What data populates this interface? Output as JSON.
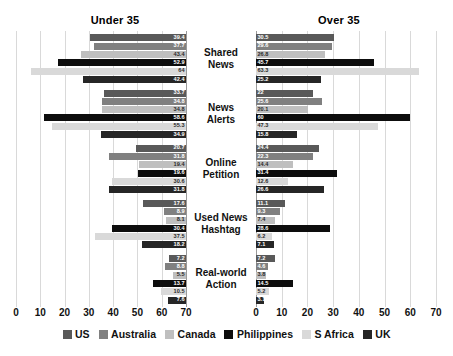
{
  "chart_data": {
    "type": "bar",
    "title": "",
    "orientation": "horizontal",
    "layout": "diverging butterfly (two mirrored panels)",
    "panels": [
      {
        "key": "under35",
        "label": "Under 35",
        "axis_direction": "reversed"
      },
      {
        "key": "over35",
        "label": "Over 35",
        "axis_direction": "normal"
      }
    ],
    "categories": [
      "Shared News",
      "News Alerts",
      "Online Petition",
      "Used News Hashtag",
      "Real-world Action"
    ],
    "category_lines": [
      [
        "Shared",
        "News"
      ],
      [
        "News",
        "Alerts"
      ],
      [
        "Online",
        "Petition"
      ],
      [
        "Used News",
        "Hashtag"
      ],
      [
        "Real-world",
        "Action"
      ]
    ],
    "series_names": [
      "US",
      "Australia",
      "Canada",
      "Philippines",
      "S Africa",
      "UK"
    ],
    "series_colors": [
      "#595959",
      "#808080",
      "#bfbfbf",
      "#0d0d0d",
      "#d9d9d9",
      "#262626"
    ],
    "xlabel": "",
    "ylabel": "",
    "xlim": [
      0,
      70
    ],
    "xticks": [
      0,
      10,
      20,
      30,
      40,
      50,
      60,
      70
    ],
    "xticks_left_display": [
      "70",
      "60",
      "50",
      "40",
      "30",
      "20",
      "10",
      "0"
    ],
    "xticks_right_display": [
      "0",
      "10",
      "20",
      "30",
      "40",
      "50",
      "60",
      "70"
    ],
    "grid": true,
    "legend_position": "bottom",
    "under35": {
      "series": [
        {
          "name": "US",
          "values": [
            39.4,
            33.7,
            20.7,
            17.6,
            7.2
          ]
        },
        {
          "name": "Australia",
          "values": [
            37.7,
            34.8,
            31.8,
            8.9,
            8.8
          ]
        },
        {
          "name": "Canada",
          "values": [
            43.4,
            34.8,
            19.4,
            8.1,
            5.5
          ]
        },
        {
          "name": "Philippines",
          "values": [
            52.9,
            58.6,
            19.6,
            30.4,
            13.7
          ]
        },
        {
          "name": "S Africa",
          "values": [
            64.0,
            55.3,
            30.6,
            37.5,
            10.5
          ]
        },
        {
          "name": "UK",
          "values": [
            42.4,
            34.9,
            31.8,
            18.2,
            7.6
          ]
        }
      ]
    },
    "over35": {
      "series": [
        {
          "name": "US",
          "values": [
            30.5,
            22.0,
            24.4,
            11.1,
            7.2
          ]
        },
        {
          "name": "Australia",
          "values": [
            29.6,
            25.6,
            22.3,
            9.3,
            4.6
          ]
        },
        {
          "name": "Canada",
          "values": [
            26.8,
            20.1,
            14.4,
            7.4,
            3.8
          ]
        },
        {
          "name": "Philippines",
          "values": [
            45.7,
            60.0,
            31.4,
            28.6,
            14.5
          ]
        },
        {
          "name": "S Africa",
          "values": [
            63.3,
            47.3,
            12.6,
            6.2,
            5.2
          ]
        },
        {
          "name": "UK",
          "values": [
            25.2,
            15.8,
            26.6,
            7.1,
            3.1
          ]
        }
      ]
    },
    "value_labels": {
      "under35": [
        [
          "39.4",
          "37.7",
          "43.4",
          "52.9",
          "64",
          "42.4"
        ],
        [
          "33.7",
          "34.8",
          "34.8",
          "58.6",
          "55.3",
          "34.9"
        ],
        [
          "20.7",
          "31.8",
          "19.4",
          "19.6",
          "30.6",
          "31.8"
        ],
        [
          "17.6",
          "8.9",
          "8.1",
          "30.4",
          "37.5",
          "18.2"
        ],
        [
          "7.2",
          "8.8",
          "5.5",
          "13.7",
          "10.5",
          "7.6"
        ]
      ],
      "over35": [
        [
          "30.5",
          "29.6",
          "26.8",
          "45.7",
          "63.3",
          "25.2"
        ],
        [
          "22",
          "25.6",
          "20.1",
          "60",
          "47.3",
          "15.8"
        ],
        [
          "24.4",
          "22.3",
          "14.4",
          "31.4",
          "12.6",
          "26.6"
        ],
        [
          "11.1",
          "9.3",
          "7.4",
          "28.6",
          "6.2",
          "7.1"
        ],
        [
          "7.2",
          "4.6",
          "3.8",
          "14.5",
          "5.2",
          "3.1"
        ]
      ]
    }
  }
}
